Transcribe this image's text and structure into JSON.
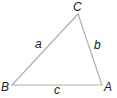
{
  "diagram": {
    "type": "triangle",
    "stroke_color": "#b0b0b0",
    "label_color": "#1a1a1a",
    "vertices": [
      {
        "name": "A",
        "x": 102,
        "y": 85
      },
      {
        "name": "B",
        "x": 12,
        "y": 85
      },
      {
        "name": "C",
        "x": 78,
        "y": 14
      }
    ],
    "vertex_labels": {
      "A": "A",
      "B": "B",
      "C": "C"
    },
    "side_labels": {
      "a": "a",
      "b": "b",
      "c": "c"
    }
  }
}
